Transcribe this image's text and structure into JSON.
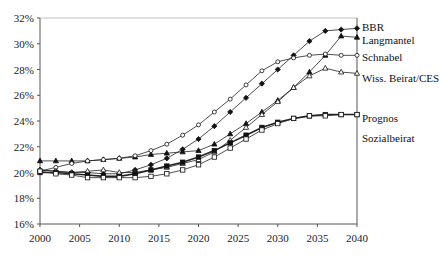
{
  "chart_data": {
    "type": "line",
    "title": "",
    "xlabel": "",
    "ylabel": "",
    "x": [
      2000,
      2002,
      2004,
      2006,
      2008,
      2010,
      2012,
      2014,
      2016,
      2018,
      2020,
      2022,
      2024,
      2026,
      2028,
      2030,
      2032,
      2034,
      2036,
      2038,
      2040
    ],
    "xlim": [
      2000,
      2040
    ],
    "ylim": [
      16,
      32
    ],
    "x_ticks": [
      "2000",
      "2005",
      "2010",
      "2015",
      "2020",
      "2025",
      "2030",
      "2035",
      "2040"
    ],
    "y_ticks": [
      "16%",
      "18%",
      "20%",
      "22%",
      "24%",
      "26%",
      "28%",
      "30%",
      "32%"
    ],
    "grid": false,
    "legend_position": "right, labels at line ends",
    "series": [
      {
        "name": "BBR",
        "marker": "filled-diamond",
        "values": [
          20.2,
          20.1,
          20.0,
          20.0,
          19.9,
          19.9,
          20.2,
          20.6,
          21.1,
          21.8,
          22.6,
          23.6,
          24.7,
          25.8,
          26.9,
          28.0,
          29.1,
          30.2,
          31.0,
          31.1,
          31.2
        ]
      },
      {
        "name": "Langmantel",
        "marker": "filled-triangle",
        "values": [
          20.9,
          20.9,
          20.9,
          20.9,
          21.0,
          21.1,
          21.2,
          21.4,
          21.5,
          21.6,
          21.7,
          22.2,
          23.0,
          23.8,
          24.7,
          25.6,
          26.6,
          27.8,
          29.1,
          30.6,
          30.5
        ]
      },
      {
        "name": "Schnabel",
        "marker": "open-circle",
        "values": [
          20.1,
          20.4,
          20.7,
          20.9,
          21.0,
          21.1,
          21.3,
          21.7,
          22.2,
          22.9,
          23.7,
          24.7,
          25.7,
          26.8,
          27.9,
          28.6,
          28.9,
          29.1,
          29.2,
          29.1,
          29.1
        ]
      },
      {
        "name": "Wiss. Beirat/CES",
        "marker": "open-triangle",
        "values": [
          20.2,
          20.1,
          20.0,
          20.1,
          20.2,
          20.0,
          20.0,
          20.2,
          20.4,
          20.7,
          21.0,
          21.6,
          22.5,
          23.5,
          24.5,
          25.5,
          26.6,
          27.5,
          28.1,
          27.8,
          27.7
        ]
      },
      {
        "name": "Prognos",
        "marker": "filled-square",
        "values": [
          20.0,
          20.0,
          19.9,
          19.8,
          19.7,
          19.7,
          19.9,
          20.2,
          20.5,
          20.8,
          21.2,
          21.7,
          22.3,
          22.9,
          23.5,
          23.9,
          24.2,
          24.4,
          24.5,
          24.5,
          24.5
        ]
      },
      {
        "name": "Sozialbeirat",
        "marker": "open-square",
        "values": [
          20.1,
          19.9,
          19.8,
          19.6,
          19.6,
          19.6,
          19.6,
          19.7,
          19.9,
          20.2,
          20.6,
          21.2,
          21.9,
          22.6,
          23.3,
          23.8,
          24.2,
          24.4,
          24.4,
          24.5,
          24.5
        ]
      }
    ]
  },
  "legend": {
    "labels": [
      "BBR",
      "Langmantel",
      "Schnabel",
      "Wiss. Beirat/CES",
      "Prognos",
      "Sozialbeirat"
    ]
  }
}
